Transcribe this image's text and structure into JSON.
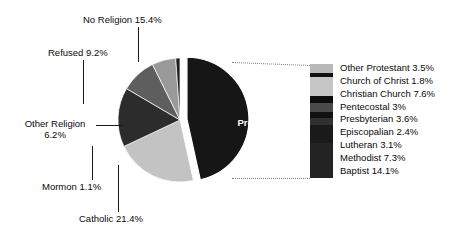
{
  "chart_data": {
    "type": "pie",
    "title": "",
    "xlabel": "",
    "ylabel": "",
    "legend_position": "right",
    "grid": false,
    "categories": [
      "Protestant",
      "Catholic",
      "No Religion",
      "Refused",
      "Other Religion",
      "Mormon"
    ],
    "values": [
      46.4,
      21.4,
      15.4,
      9.2,
      6.2,
      1.1
    ],
    "slices": [
      {
        "label": "Protestant",
        "value": 46.4,
        "text": "Protestant 46.4%",
        "color": "#161616",
        "exploded": true
      },
      {
        "label": "Catholic",
        "value": 21.4,
        "text": "Catholic 21.4%",
        "color": "#c3c3c3",
        "exploded": false
      },
      {
        "label": "No Religion",
        "value": 15.4,
        "text": "No Religion 15.4%",
        "color": "#2c2c2c",
        "exploded": false
      },
      {
        "label": "Refused",
        "value": 9.2,
        "text": "Refused 9.2%",
        "color": "#5e5e5e",
        "exploded": false
      },
      {
        "label": "Other Religion",
        "value": 6.2,
        "text": "Other Religion 6.2%",
        "color": "#9a9a9a",
        "exploded": false
      },
      {
        "label": "Mormon",
        "value": 1.1,
        "text": "Mormon 1.1%",
        "color": "#1e1e1e",
        "exploded": false
      }
    ],
    "breakout": {
      "of_slice": "Protestant",
      "type": "stacked_bar",
      "total": 46.4,
      "categories": [
        "Other Protestant",
        "Church of Christ",
        "Christian Church",
        "Pentecostal",
        "Presbyterian",
        "Episcopalian",
        "Lutheran",
        "Methodist",
        "Baptist"
      ],
      "values": [
        3.5,
        1.8,
        7.6,
        3.0,
        3.6,
        2.4,
        3.1,
        7.3,
        14.1
      ],
      "items": [
        {
          "label": "Other Protestant 3.5%",
          "value": 3.5,
          "color": "#b9b9b9"
        },
        {
          "label": "Church of Christ 1.8%",
          "value": 1.8,
          "color": "#101010"
        },
        {
          "label": "Christian Church 7.6%",
          "value": 7.6,
          "color": "#c6c6c6"
        },
        {
          "label": "Pentecostal 3%",
          "value": 3.0,
          "color": "#0d0d0d"
        },
        {
          "label": "Presbyterian 3.6%",
          "value": 3.6,
          "color": "#4a4a4a"
        },
        {
          "label": "Episcopalian 2.4%",
          "value": 2.4,
          "color": "#111111"
        },
        {
          "label": "Lutheran 3.1%",
          "value": 3.1,
          "color": "#313131"
        },
        {
          "label": "Methodist 7.3%",
          "value": 7.3,
          "color": "#1a1a1a"
        },
        {
          "label": "Baptist 14.1%",
          "value": 14.1,
          "color": "#232323"
        }
      ]
    }
  },
  "labels": {
    "no_religion": "No Religion 15.4%",
    "refused": "Refused 9.2%",
    "other_religion_l1": "Other Religion",
    "other_religion_l2": "6.2%",
    "mormon": "Mormon 1.1%",
    "catholic": "Catholic 21.4%",
    "protestant_l1": "Protestant",
    "protestant_l2": "46.4%"
  },
  "legend": {
    "rows": [
      "Other Protestant 3.5%",
      "Church of Christ 1.8%",
      "Christian Church 7.6%",
      "Pentecostal 3%",
      "Presbyterian 3.6%",
      "Episcopalian 2.4%",
      "Lutheran 3.1%",
      "Methodist 7.3%",
      "Baptist 14.1%"
    ]
  },
  "colors": {
    "background": "#ffffff",
    "text": "#0a0a0a",
    "leader": "#1a1a1a",
    "dotted_leader": "#7d7d7d"
  }
}
